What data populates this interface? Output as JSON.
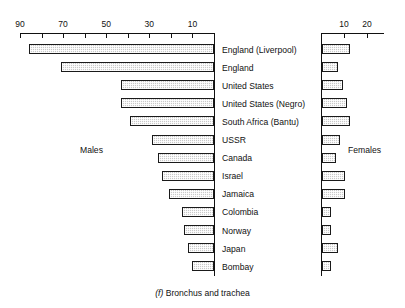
{
  "figure": {
    "caption_index": "(f)",
    "caption_text": "Bronchus and trachea",
    "males_label": "Males",
    "females_label": "Females"
  },
  "chart_data": {
    "type": "bar",
    "orientation": "horizontal",
    "title": "(f) Bronchus and trachea",
    "xlabel": "",
    "ylabel": "",
    "grid": false,
    "legend_position": "inline",
    "panels": [
      {
        "name": "Males",
        "direction": "right-to-left",
        "axis_ticks": [
          90,
          80,
          70,
          60,
          50,
          40,
          30,
          20,
          10,
          0
        ],
        "axis_tick_labels": [
          "90",
          "",
          "70",
          "",
          "50",
          "",
          "30",
          "",
          "10",
          ""
        ],
        "xlim": [
          0,
          90
        ]
      },
      {
        "name": "Females",
        "direction": "left-to-right",
        "axis_ticks": [
          0,
          10,
          20
        ],
        "axis_tick_labels": [
          "",
          "10",
          "20"
        ],
        "xlim": [
          0,
          24
        ]
      }
    ],
    "categories": [
      "England  (Liverpool)",
      "England",
      "United  States",
      "United  States  (Negro)",
      "South  Africa  (Bantu)",
      "USSR",
      "Canada",
      "Israel",
      "Jamaica",
      "Colombia",
      "Norway",
      "Japan",
      "Bombay"
    ],
    "series": [
      {
        "name": "Males",
        "values": [
          86,
          71,
          43,
          43,
          39,
          29,
          26,
          24,
          21,
          15,
          14,
          12,
          10
        ]
      },
      {
        "name": "Females",
        "values": [
          12,
          7,
          9,
          11,
          12,
          8,
          6,
          10,
          10,
          4,
          4,
          7,
          4
        ]
      }
    ]
  },
  "style": {
    "bar_fill": "#c9c9c9",
    "bar_stroke": "#1a1a1a",
    "axis_color": "#111111",
    "background": "#ffffff"
  }
}
